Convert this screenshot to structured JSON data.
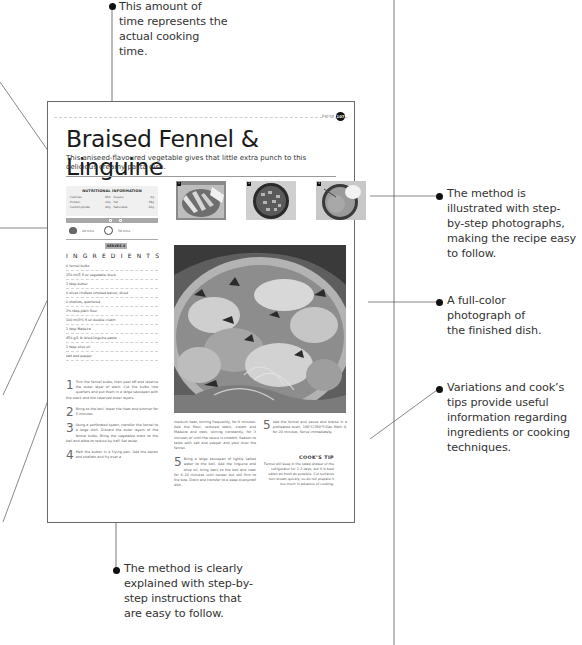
{
  "callouts": {
    "cooking_time": "This amount of time represents the actual cooking time.",
    "step_photos": "The method is illustrated with step-by-step photographs, making the recipe easy to follow.",
    "full_color_photo": "A full-color photograph of the finished dish.",
    "variations_tips": "Variations and cook’s tips provide useful information regarding ingredients or cooking techniques.",
    "method_instructions": "The method is clearly explained with step-by-step instructions that are easy to follow."
  },
  "page": {
    "section_label": "Baking",
    "page_number": "107",
    "title": "Braised Fennel & Linguine",
    "subtitle": "This aniseed-flavoured vegetable gives that little extra punch to this delicious creamy pasta dish.",
    "nutrition": {
      "heading": "NUTRITIONAL INFORMATION",
      "rows": [
        {
          "label": "Calories",
          "value": "650"
        },
        {
          "label": "Sugars",
          "value": "4g"
        },
        {
          "label": "Protein",
          "value": "14g"
        },
        {
          "label": "Fat",
          "value": "39g"
        },
        {
          "label": "Carbohydrate",
          "value": "40g"
        },
        {
          "label": "Saturates",
          "value": "22g"
        }
      ]
    },
    "timing": {
      "prep": "20 mins",
      "cook": "50 mins"
    },
    "serves": "SERVES 4",
    "ingredients_heading": "INGREDIENTS",
    "ingredients": [
      "6 fennel bulbs",
      "150 ml/5 fl oz vegetable stock",
      "2 tbsp butter",
      "6 slices rindless smoked bacon, diced",
      "6 shallots, quartered",
      "2½ tbsp plain flour",
      "100 ml/3½ fl oz double cream",
      "1 tbsp Madeira",
      "450 g/1 lb dried linguine pasta",
      "1 tbsp olive oil",
      "salt and pepper"
    ],
    "steps": [
      {
        "num": "1",
        "text": "Trim the fennel bulbs, then peel off and reserve the outer layer of each. Cut the bulbs into quarters and put them in a large saucepan with the stock and the reserved outer layers."
      },
      {
        "num": "2",
        "text": "Bring to the boil, lower the heat and simmer for 5 minutes."
      },
      {
        "num": "3",
        "text": "Using a perforated spoon, transfer the fennel to a large dish. Discard the outer layers of the fennel bulbs. Bring the vegetable stock to the boil and allow to reduce by half. Set aside."
      },
      {
        "num": "4",
        "text": "Melt the butter in a frying pan. Add the bacon and shallots and fry over a"
      },
      {
        "num": "",
        "text": "medium heat, stirring frequently, for 4 minutes. Add the flour, reduced stock, cream and Madeira and cook, stirring constantly, for 3 minutes or until the sauce is smooth. Season to taste with salt and pepper and pour over the fennel."
      },
      {
        "num": "5",
        "text": "Bring a large saucepan of lightly salted water to the boil. Add the linguine and olive oil, bring back to the boil and cook for 8–10 minutes until tender but still firm to the bite. Drain and transfer to a deep ovenproof dish."
      },
      {
        "num": "5",
        "text": "Add the fennel and sauce and braise in a preheated oven, 180°C/350°F/Gas Mark 4, for 20 minutes. Serve immediately."
      }
    ],
    "thumbnails": [
      {
        "badge": "1"
      },
      {
        "badge": "4"
      },
      {
        "badge": "4"
      }
    ],
    "cooks_tip": {
      "heading": "COOK’S TIP",
      "text": "Fennel will keep in the salad drawer of the refrigerator for 2–3 days, but it is best eaten as fresh as possible. Cut surfaces turn brown quickly, so do not prepare it too much in advance of cooking."
    }
  }
}
